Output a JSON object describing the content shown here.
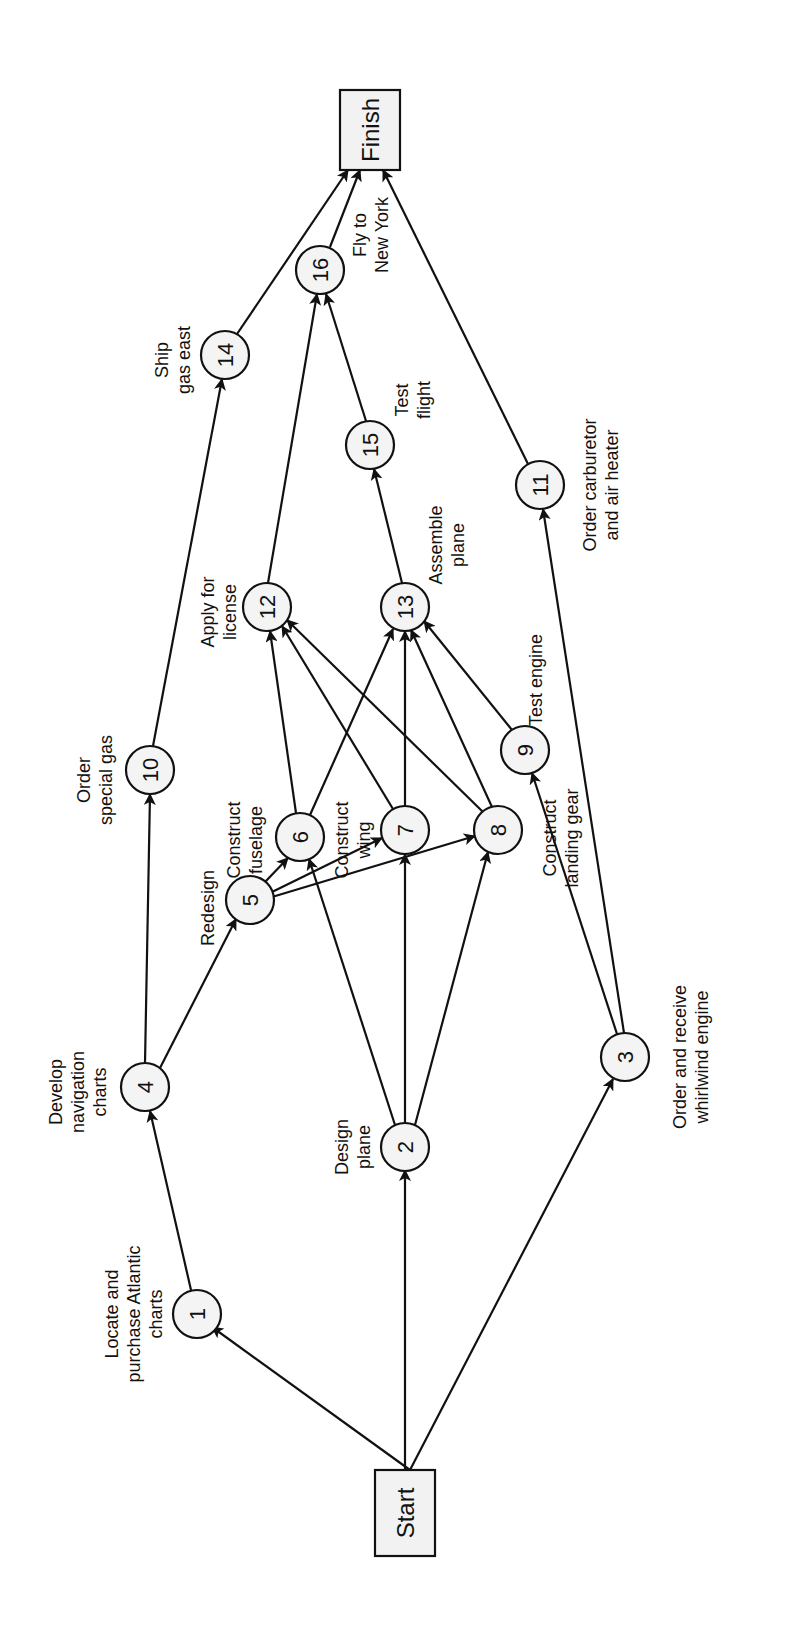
{
  "diagram": {
    "type": "activity-on-node network (rotated 90° counter-clockwise)",
    "terminals": {
      "start": {
        "label": "Start"
      },
      "finish": {
        "label": "Finish"
      }
    },
    "nodes": [
      {
        "id": "1",
        "label": [
          "Locate and",
          "purchase Atlantic",
          "charts"
        ]
      },
      {
        "id": "2",
        "label": [
          "Design",
          "plane"
        ]
      },
      {
        "id": "3",
        "label": [
          "Order and receive",
          "whirlwind engine"
        ]
      },
      {
        "id": "4",
        "label": [
          "Develop",
          "navigation",
          "charts"
        ]
      },
      {
        "id": "5",
        "label": [
          "Redesign"
        ]
      },
      {
        "id": "6",
        "label": [
          "Construct",
          "fuselage"
        ]
      },
      {
        "id": "7",
        "label": [
          "Construct",
          "wing"
        ]
      },
      {
        "id": "8",
        "label": [
          "Construct",
          "landing gear"
        ]
      },
      {
        "id": "9",
        "label": [
          "Test engine"
        ]
      },
      {
        "id": "10",
        "label": [
          "Order",
          "special gas"
        ]
      },
      {
        "id": "11",
        "label": [
          "Order carburetor",
          "and air heater"
        ]
      },
      {
        "id": "12",
        "label": [
          "Apply for",
          "license"
        ]
      },
      {
        "id": "13",
        "label": [
          "Assemble",
          "plane"
        ]
      },
      {
        "id": "14",
        "label": [
          "Ship",
          "gas east"
        ]
      },
      {
        "id": "15",
        "label": [
          "Test",
          "flight"
        ]
      },
      {
        "id": "16",
        "label": [
          "Fly to",
          "New York"
        ]
      }
    ],
    "edges": [
      [
        "Start",
        "1"
      ],
      [
        "Start",
        "2"
      ],
      [
        "Start",
        "3"
      ],
      [
        "1",
        "4"
      ],
      [
        "4",
        "10"
      ],
      [
        "4",
        "5"
      ],
      [
        "5",
        "6"
      ],
      [
        "5",
        "7"
      ],
      [
        "5",
        "8"
      ],
      [
        "2",
        "6"
      ],
      [
        "2",
        "7"
      ],
      [
        "2",
        "8"
      ],
      [
        "3",
        "9"
      ],
      [
        "3",
        "11"
      ],
      [
        "10",
        "14"
      ],
      [
        "6",
        "12"
      ],
      [
        "7",
        "12"
      ],
      [
        "8",
        "12"
      ],
      [
        "6",
        "13"
      ],
      [
        "7",
        "13"
      ],
      [
        "8",
        "13"
      ],
      [
        "9",
        "13"
      ],
      [
        "12",
        "16"
      ],
      [
        "13",
        "15"
      ],
      [
        "15",
        "16"
      ],
      [
        "14",
        "Finish"
      ],
      [
        "16",
        "Finish"
      ],
      [
        "11",
        "Finish"
      ]
    ]
  }
}
